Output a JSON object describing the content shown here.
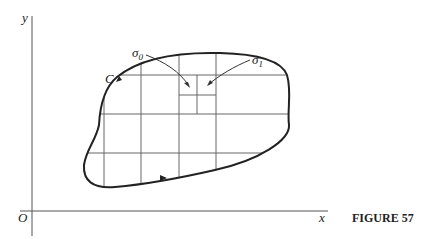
{
  "figure": {
    "caption": "FIGURE 57",
    "axes": {
      "x_label": "x",
      "y_label": "y",
      "origin_label": "O"
    },
    "curve_label": "C",
    "subregion_labels": {
      "sigma0": "σ",
      "sigma0_sub": "0",
      "sigma1": "σ",
      "sigma1_sub": "1"
    }
  }
}
